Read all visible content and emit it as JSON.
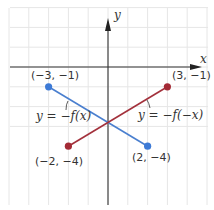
{
  "axes": {
    "x_label": "x",
    "y_label": "y",
    "origin_px": [
      108,
      67
    ],
    "unit_px": 19.8,
    "x_range": [
      -5,
      5
    ],
    "y_range": [
      -7,
      3
    ]
  },
  "colors": {
    "grid": "#e6e6e6",
    "axis": "#333333",
    "blue_line": "#4a7fcf",
    "red_line": "#a3313c",
    "blue_dot": "#3d7ad6",
    "red_dot": "#a32a35"
  },
  "segments": [
    {
      "name": "neg-f-x",
      "equation": "y = −f(x)",
      "color": "blue",
      "start": {
        "x": -3,
        "y": -1,
        "label": "(−3, −1)"
      },
      "end": {
        "x": 2,
        "y": -4,
        "label": "(2, −4)"
      }
    },
    {
      "name": "neg-f-neg-x",
      "equation": "y = −f(−x)",
      "color": "red",
      "start": {
        "x": -2,
        "y": -4,
        "label": "(−2, −4)"
      },
      "end": {
        "x": 3,
        "y": -1,
        "label": "(3, −1)"
      }
    }
  ],
  "labels": {
    "p1": "(−3, −1)",
    "p2": "(3, −1)",
    "p3": "(−2, −4)",
    "p4": "(2, −4)",
    "eq_blue": "y = −f(x)",
    "eq_red": "y = −f(−x)"
  }
}
